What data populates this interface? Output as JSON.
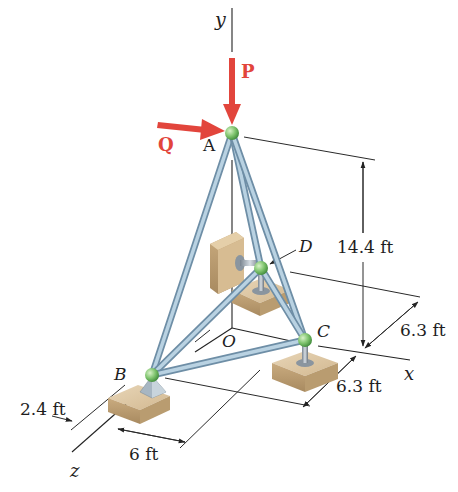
{
  "figure": {
    "type": "3d-space-truss-statics-diagram",
    "background": "#ffffff"
  },
  "axes": {
    "y_label": "y",
    "x_label": "x",
    "z_label": "z",
    "origin_label": "O"
  },
  "joints": {
    "A": {
      "label": "A",
      "x": 232,
      "y": 133
    },
    "B": {
      "label": "B",
      "x": 152,
      "y": 375
    },
    "C": {
      "label": "C",
      "x": 305,
      "y": 340
    },
    "D": {
      "label": "D",
      "x": 261,
      "y": 268
    }
  },
  "forces": {
    "P": {
      "label": "P",
      "direction": "down (-y)",
      "color": "#e2453c"
    },
    "Q": {
      "label": "Q",
      "direction": "+x",
      "color": "#e2453c"
    }
  },
  "dimensions": {
    "height": "14.4 ft",
    "c_x_offset": "6.3 ft",
    "c_z_offset": "6.3 ft",
    "b_z_offset": "2.4 ft",
    "b_x_offset": "6 ft"
  },
  "colors": {
    "force": "#e2453c",
    "joint": "#7fc46e",
    "member": "#a9c6d9",
    "support_block": "#c9ae86"
  }
}
